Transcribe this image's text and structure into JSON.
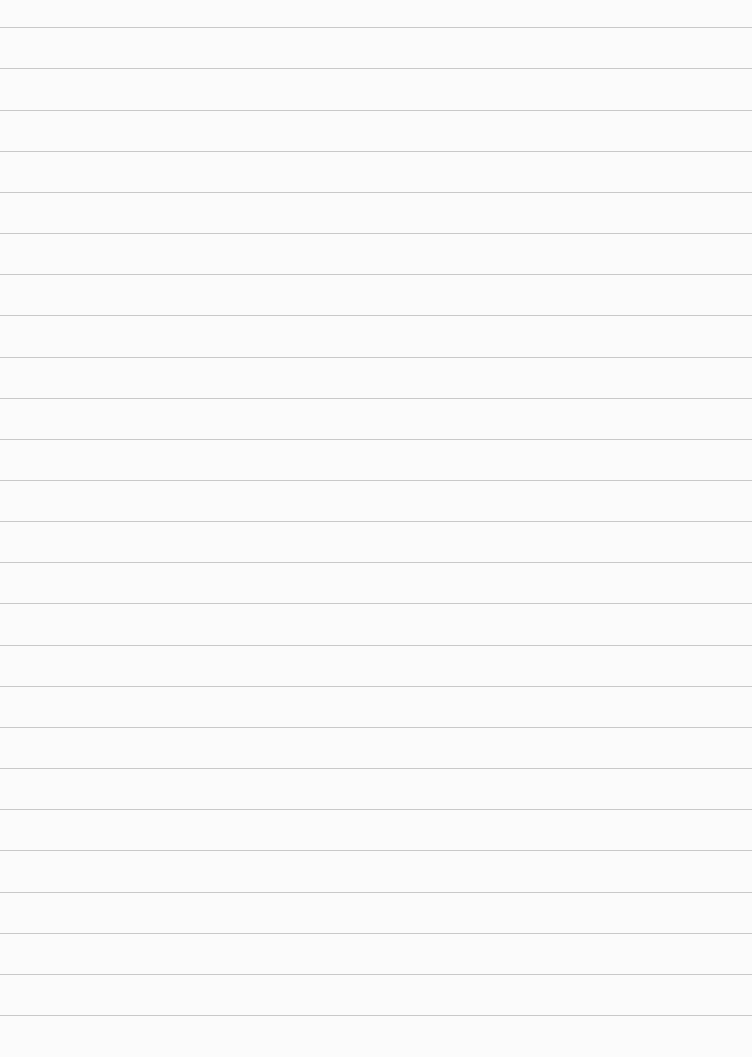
{
  "page": {
    "type": "lined-paper",
    "background_color": "#fbfbfb",
    "line_color": "#c9c9c9",
    "line_count": 25,
    "line_positions": [
      27,
      68,
      110,
      151,
      192,
      233,
      274,
      315,
      357,
      398,
      439,
      480,
      521,
      562,
      603,
      645,
      686,
      727,
      768,
      809,
      850,
      892,
      933,
      974,
      1015
    ]
  }
}
